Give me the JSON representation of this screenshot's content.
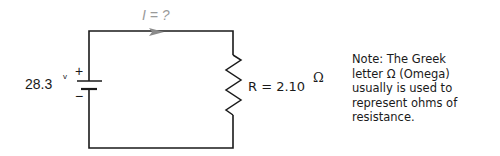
{
  "diagram": {
    "type": "circuit",
    "current_label": "I = ?",
    "battery": {
      "voltage_label": "28.3",
      "unit": "v",
      "plus": "+",
      "minus": "−"
    },
    "resistor": {
      "label": "R = 2.10",
      "unit": "Ω"
    },
    "colors": {
      "wire": "#1a1a1a",
      "current": "#8a8a8a"
    }
  },
  "note": {
    "lines": [
      "Note: The Greek",
      "letter Ω (Omega)",
      "usually is used to",
      "represent ohms of",
      "resistance."
    ]
  }
}
